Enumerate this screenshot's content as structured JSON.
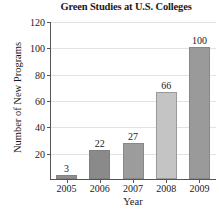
{
  "chart_data": {
    "type": "bar",
    "title": "Green Studies at U.S. Colleges",
    "xlabel": "Year",
    "ylabel": "Number of New Programs",
    "categories": [
      "2005",
      "2006",
      "2007",
      "2008",
      "2009"
    ],
    "values": [
      3,
      22,
      27,
      66,
      100
    ],
    "value_labels": [
      "3",
      "22",
      "27",
      "66",
      "100"
    ],
    "bar_colors": [
      "#8f8f8f",
      "#8a8a8a",
      "#9c9c9c",
      "#c4c4c4",
      "#9a9a9a"
    ],
    "ylim": [
      0,
      120
    ],
    "yticks": [
      20,
      40,
      60,
      80,
      100,
      120
    ],
    "ytick_labels": [
      "20",
      "40",
      "60",
      "80",
      "100",
      "120"
    ],
    "grid": true,
    "legend": false,
    "legend_position": "none"
  }
}
